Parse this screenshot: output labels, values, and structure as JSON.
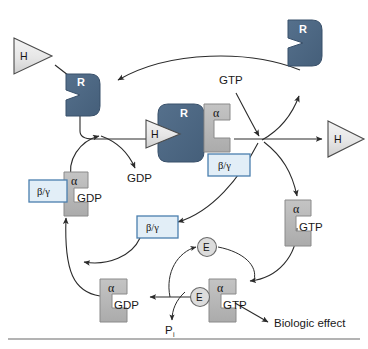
{
  "figure": {
    "background_color": "#ffffff"
  },
  "colors": {
    "receptor_fill": "#4a6480",
    "receptor_stroke": "#39506a",
    "subunit_fill": "#b9b9b9",
    "subunit_stroke": "#8a8a8a",
    "bg_box_fill": "#e2eef7",
    "bg_box_stroke": "#4a7fae",
    "hormone_fill": "#e9e9e9",
    "hormone_stroke": "#4a4a4a",
    "effector_fill": "#dcdcdc",
    "effector_stroke": "#6a6a6a",
    "arrow": "#2b2b2b",
    "baseline": "#9a9a9a"
  },
  "nodes": {
    "hormone_free_left": {
      "label": "H",
      "name": "hormone-free-left"
    },
    "hormone_free_right": {
      "label": "H",
      "name": "hormone-free-right"
    },
    "hormone_bound": {
      "label": "H",
      "name": "hormone-bound-center"
    },
    "receptor_unbound_left": {
      "label": "R",
      "name": "receptor-unbound-left"
    },
    "receptor_recycled_right": {
      "label": "R",
      "name": "receptor-recycled-right"
    },
    "receptor_bound_center": {
      "label": "R",
      "name": "receptor-bound-center"
    },
    "alpha_gdp_inactive": {
      "alpha": "α",
      "nucleotide": "GDP",
      "name": "alpha-gdp-heterotrimer"
    },
    "beta_gamma_bound_left": {
      "label": "β/γ",
      "name": "beta-gamma-bound-left"
    },
    "alpha_center_complex": {
      "alpha": "α",
      "name": "alpha-receptor-complex"
    },
    "beta_gamma_center": {
      "label": "β/γ",
      "name": "beta-gamma-center"
    },
    "beta_gamma_released": {
      "label": "β/γ",
      "name": "beta-gamma-released"
    },
    "alpha_gtp_active": {
      "alpha": "α",
      "nucleotide": "GTP",
      "name": "alpha-gtp-active"
    },
    "alpha_gtp_effector": {
      "alpha": "α",
      "nucleotide": "GTP",
      "name": "alpha-gtp-effector-bound"
    },
    "alpha_gdp_hydrolyzed": {
      "alpha": "α",
      "nucleotide": "GDP",
      "name": "alpha-gdp-hydrolyzed"
    },
    "effector_free": {
      "label": "E",
      "name": "effector-free"
    },
    "effector_bound": {
      "label": "E",
      "name": "effector-bound"
    }
  },
  "labels": {
    "gtp_in": "GTP",
    "gdp_out": "GDP",
    "phosphate": "P",
    "phosphate_subscript": "i",
    "biologic_effect": "Biologic effect"
  }
}
